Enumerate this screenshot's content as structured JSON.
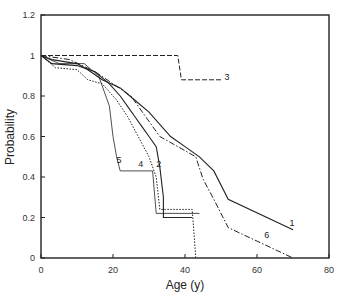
{
  "chart_data": {
    "type": "line",
    "title": "",
    "xlabel": "Age (y)",
    "ylabel": "Probability",
    "xlim": [
      0,
      80
    ],
    "ylim": [
      0,
      1.2
    ],
    "xticks": [
      0,
      20,
      40,
      60,
      80
    ],
    "yticks": [
      0,
      0.2,
      0.4,
      0.6,
      0.8,
      1,
      1.2
    ],
    "ytick_labels": [
      "0",
      "0.2",
      "0.4",
      "0.6",
      "0.8",
      "1",
      "1.2"
    ],
    "grid": false,
    "legend": "inline curve labels",
    "series": [
      {
        "name": "1",
        "style": "solid",
        "points": [
          [
            0,
            1
          ],
          [
            3,
            0.98
          ],
          [
            10,
            0.96
          ],
          [
            13,
            0.93
          ],
          [
            17,
            0.88
          ],
          [
            22,
            0.84
          ],
          [
            26,
            0.78
          ],
          [
            30,
            0.72
          ],
          [
            33,
            0.66
          ],
          [
            36,
            0.6
          ],
          [
            40,
            0.55
          ],
          [
            44,
            0.5
          ],
          [
            48,
            0.43
          ],
          [
            52,
            0.29
          ],
          [
            70,
            0.14
          ]
        ]
      },
      {
        "name": "2",
        "style": "solid",
        "points": [
          [
            0,
            1
          ],
          [
            3,
            0.96
          ],
          [
            10,
            0.95
          ],
          [
            15,
            0.92
          ],
          [
            19,
            0.86
          ],
          [
            22,
            0.8
          ],
          [
            24,
            0.75
          ],
          [
            26,
            0.7
          ],
          [
            28,
            0.65
          ],
          [
            30,
            0.6
          ],
          [
            32,
            0.55
          ],
          [
            33,
            0.45
          ],
          [
            34,
            0.3
          ],
          [
            34,
            0.2
          ],
          [
            42,
            0.2
          ]
        ]
      },
      {
        "name": "3",
        "style": "dashed",
        "points": [
          [
            0,
            1
          ],
          [
            38,
            1
          ],
          [
            39,
            0.88
          ],
          [
            50,
            0.88
          ]
        ]
      },
      {
        "name": "4",
        "style": "dotted",
        "points": [
          [
            0,
            1
          ],
          [
            4,
            0.94
          ],
          [
            10,
            0.93
          ],
          [
            13,
            0.88
          ],
          [
            17,
            0.86
          ],
          [
            21,
            0.78
          ],
          [
            24,
            0.7
          ],
          [
            27,
            0.6
          ],
          [
            30,
            0.5
          ],
          [
            32,
            0.4
          ],
          [
            33,
            0.24
          ],
          [
            42,
            0.24
          ],
          [
            43,
            0.0
          ]
        ]
      },
      {
        "name": "5",
        "style": "solid-thin",
        "points": [
          [
            0,
            1
          ],
          [
            5,
            0.96
          ],
          [
            12,
            0.96
          ],
          [
            16,
            0.9
          ],
          [
            19,
            0.75
          ],
          [
            20,
            0.6
          ],
          [
            21,
            0.5
          ],
          [
            22,
            0.43
          ],
          [
            31,
            0.43
          ],
          [
            32,
            0.22
          ],
          [
            44,
            0.22
          ]
        ]
      },
      {
        "name": "6",
        "style": "dash-dot",
        "points": [
          [
            0,
            1
          ],
          [
            8,
            0.98
          ],
          [
            15,
            0.92
          ],
          [
            20,
            0.86
          ],
          [
            25,
            0.8
          ],
          [
            29,
            0.7
          ],
          [
            33,
            0.6
          ],
          [
            38,
            0.55
          ],
          [
            43,
            0.5
          ],
          [
            45,
            0.39
          ],
          [
            48,
            0.29
          ],
          [
            52,
            0.15
          ],
          [
            70,
            0.0
          ]
        ]
      }
    ],
    "annotations": [
      {
        "text": "1",
        "x": 69,
        "y": 0.16
      },
      {
        "text": "2",
        "x": 32,
        "y": 0.45
      },
      {
        "text": "3",
        "x": 51,
        "y": 0.88
      },
      {
        "text": "4",
        "x": 27,
        "y": 0.45
      },
      {
        "text": "5",
        "x": 21,
        "y": 0.47
      },
      {
        "text": "6",
        "x": 62,
        "y": 0.1
      }
    ]
  }
}
